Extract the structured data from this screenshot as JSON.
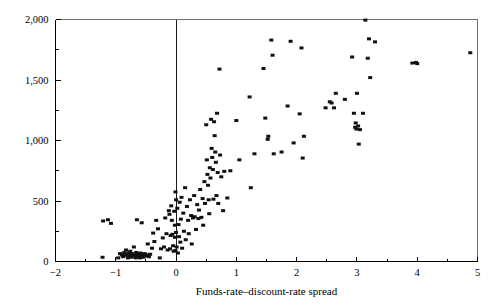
{
  "chart": {
    "type": "scatter",
    "title": "",
    "xlabel": "Funds-rate–discount-rate spread",
    "ylabel": "",
    "xlim": [
      -2,
      5
    ],
    "ylim": [
      0,
      2000
    ],
    "grid": false,
    "legend": null,
    "marker": {
      "shape": "square",
      "color": "#111111",
      "width": 4,
      "height": 3
    },
    "reference_lines": [
      {
        "axis": "x",
        "value": 0,
        "color": "#000000"
      }
    ],
    "xticks": [
      -2,
      -1,
      0,
      1,
      2,
      3,
      4,
      5
    ],
    "xtick_labels": [
      "−2",
      "−1",
      "0",
      "1",
      "2",
      "3",
      "4",
      "5"
    ],
    "xminor_ticks": [
      -1.5,
      -0.5,
      0.5,
      1.5,
      2.5,
      3.5,
      4.5
    ],
    "yticks": [
      0,
      500,
      1000,
      1500,
      2000
    ],
    "ytick_labels": [
      "0",
      "500",
      "1,000",
      "1,500",
      "2,000"
    ],
    "yminor_ticks": [
      250,
      750,
      1250,
      1750
    ],
    "points": [
      [
        -1.21,
        335
      ],
      [
        -1.13,
        345
      ],
      [
        -1.08,
        315
      ],
      [
        -1.22,
        35
      ],
      [
        -0.96,
        30
      ],
      [
        -0.93,
        65
      ],
      [
        -0.9,
        55
      ],
      [
        -0.88,
        40
      ],
      [
        -0.86,
        75
      ],
      [
        -0.85,
        50
      ],
      [
        -0.83,
        95
      ],
      [
        -0.82,
        60
      ],
      [
        -0.8,
        30
      ],
      [
        -0.79,
        70
      ],
      [
        -0.78,
        45
      ],
      [
        -0.76,
        85
      ],
      [
        -0.75,
        55
      ],
      [
        -0.74,
        35
      ],
      [
        -0.73,
        65
      ],
      [
        -0.72,
        50
      ],
      [
        -0.7,
        120
      ],
      [
        -0.69,
        45
      ],
      [
        -0.68,
        60
      ],
      [
        -0.67,
        30
      ],
      [
        -0.66,
        75
      ],
      [
        -0.65,
        345
      ],
      [
        -0.64,
        55
      ],
      [
        -0.63,
        40
      ],
      [
        -0.62,
        65
      ],
      [
        -0.61,
        45
      ],
      [
        -0.6,
        30
      ],
      [
        -0.59,
        70
      ],
      [
        -0.58,
        55
      ],
      [
        -0.57,
        320
      ],
      [
        -0.56,
        60
      ],
      [
        -0.55,
        50
      ],
      [
        -0.54,
        35
      ],
      [
        -0.52,
        65
      ],
      [
        -0.5,
        45
      ],
      [
        -0.48,
        55
      ],
      [
        -0.47,
        145
      ],
      [
        -0.45,
        40
      ],
      [
        -0.43,
        60
      ],
      [
        -0.4,
        110
      ],
      [
        -0.38,
        235
      ],
      [
        -0.36,
        165
      ],
      [
        -0.33,
        340
      ],
      [
        -0.3,
        270
      ],
      [
        -0.27,
        30
      ],
      [
        -0.25,
        105
      ],
      [
        -0.22,
        195
      ],
      [
        -0.2,
        120
      ],
      [
        -0.18,
        360
      ],
      [
        -0.16,
        230
      ],
      [
        -0.14,
        95
      ],
      [
        -0.12,
        420
      ],
      [
        -0.11,
        390
      ],
      [
        -0.1,
        105
      ],
      [
        -0.09,
        215
      ],
      [
        -0.08,
        460
      ],
      [
        -0.07,
        340
      ],
      [
        -0.06,
        225
      ],
      [
        -0.05,
        130
      ],
      [
        -0.04,
        85
      ],
      [
        -0.03,
        415
      ],
      [
        -0.02,
        200
      ],
      [
        -0.02,
        300
      ],
      [
        -0.01,
        575
      ],
      [
        -0.01,
        90
      ],
      [
        0.0,
        510
      ],
      [
        0.0,
        240
      ],
      [
        0.01,
        120
      ],
      [
        0.02,
        440
      ],
      [
        0.03,
        70
      ],
      [
        0.04,
        305
      ],
      [
        0.05,
        205
      ],
      [
        0.06,
        490
      ],
      [
        0.07,
        160
      ],
      [
        0.08,
        350
      ],
      [
        0.09,
        530
      ],
      [
        0.1,
        110
      ],
      [
        0.12,
        400
      ],
      [
        0.13,
        250
      ],
      [
        0.15,
        610
      ],
      [
        0.16,
        180
      ],
      [
        0.18,
        455
      ],
      [
        0.2,
        340
      ],
      [
        0.21,
        230
      ],
      [
        0.23,
        510
      ],
      [
        0.25,
        380
      ],
      [
        0.26,
        145
      ],
      [
        0.28,
        360
      ],
      [
        0.3,
        545
      ],
      [
        0.31,
        370
      ],
      [
        0.33,
        265
      ],
      [
        0.35,
        470
      ],
      [
        0.37,
        355
      ],
      [
        0.38,
        425
      ],
      [
        0.4,
        595
      ],
      [
        0.42,
        365
      ],
      [
        0.44,
        520
      ],
      [
        0.45,
        300
      ],
      [
        0.47,
        660
      ],
      [
        0.48,
        480
      ],
      [
        0.5,
        1130
      ],
      [
        0.51,
        840
      ],
      [
        0.52,
        720
      ],
      [
        0.53,
        630
      ],
      [
        0.54,
        510
      ],
      [
        0.55,
        395
      ],
      [
        0.56,
        775
      ],
      [
        0.57,
        690
      ],
      [
        0.58,
        1175
      ],
      [
        0.59,
        935
      ],
      [
        0.6,
        860
      ],
      [
        0.61,
        760
      ],
      [
        0.62,
        515
      ],
      [
        0.63,
        1155
      ],
      [
        0.64,
        1040
      ],
      [
        0.65,
        905
      ],
      [
        0.66,
        820
      ],
      [
        0.67,
        545
      ],
      [
        0.68,
        1225
      ],
      [
        0.69,
        735
      ],
      [
        0.7,
        480
      ],
      [
        0.72,
        1590
      ],
      [
        0.73,
        880
      ],
      [
        0.75,
        700
      ],
      [
        0.78,
        420
      ],
      [
        0.8,
        745
      ],
      [
        0.85,
        525
      ],
      [
        0.9,
        750
      ],
      [
        1.0,
        1165
      ],
      [
        1.05,
        840
      ],
      [
        1.22,
        1360
      ],
      [
        1.24,
        610
      ],
      [
        1.3,
        890
      ],
      [
        1.45,
        1595
      ],
      [
        1.48,
        1185
      ],
      [
        1.52,
        1010
      ],
      [
        1.53,
        1035
      ],
      [
        1.58,
        1830
      ],
      [
        1.6,
        1705
      ],
      [
        1.62,
        890
      ],
      [
        1.75,
        905
      ],
      [
        1.85,
        1285
      ],
      [
        1.9,
        1820
      ],
      [
        1.95,
        980
      ],
      [
        2.05,
        1220
      ],
      [
        2.08,
        1765
      ],
      [
        2.1,
        855
      ],
      [
        2.12,
        1035
      ],
      [
        2.48,
        1270
      ],
      [
        2.55,
        1320
      ],
      [
        2.58,
        1310
      ],
      [
        2.62,
        1270
      ],
      [
        2.65,
        1390
      ],
      [
        2.8,
        1340
      ],
      [
        2.92,
        1690
      ],
      [
        2.95,
        1225
      ],
      [
        2.97,
        1110
      ],
      [
        2.98,
        1145
      ],
      [
        2.99,
        1095
      ],
      [
        3.0,
        1390
      ],
      [
        3.02,
        1120
      ],
      [
        3.03,
        970
      ],
      [
        3.05,
        1090
      ],
      [
        3.1,
        1225
      ],
      [
        3.14,
        1995
      ],
      [
        3.18,
        1680
      ],
      [
        3.2,
        1840
      ],
      [
        3.22,
        1520
      ],
      [
        3.3,
        1815
      ],
      [
        3.92,
        1640
      ],
      [
        3.98,
        1645
      ],
      [
        4.0,
        1635
      ],
      [
        4.88,
        1725
      ]
    ]
  }
}
